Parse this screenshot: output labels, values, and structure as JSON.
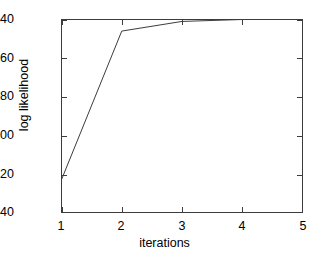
{
  "chart_data": {
    "type": "line",
    "title": "",
    "subtitle": "",
    "xlabel": "iterations",
    "ylabel": "log likelihood",
    "x": [
      1,
      2,
      3,
      4,
      5
    ],
    "values": [
      123,
      46,
      41,
      40,
      40
    ],
    "series": [
      {
        "name": "log likelihood",
        "values": [
          123,
          46,
          41,
          40,
          40
        ]
      }
    ],
    "xticks": [
      "1",
      "2",
      "3",
      "4",
      "5"
    ],
    "yticks": [
      "40",
      "60",
      "80",
      "100",
      "120",
      "140"
    ],
    "xlim": [
      1,
      5
    ],
    "ylim": [
      140,
      40
    ],
    "y_axis_inverted": true,
    "grid": false,
    "legend": "none",
    "line_color": "#3c3c3c",
    "frame_color": "#3c3c3c",
    "background_color": "#ffffff"
  }
}
